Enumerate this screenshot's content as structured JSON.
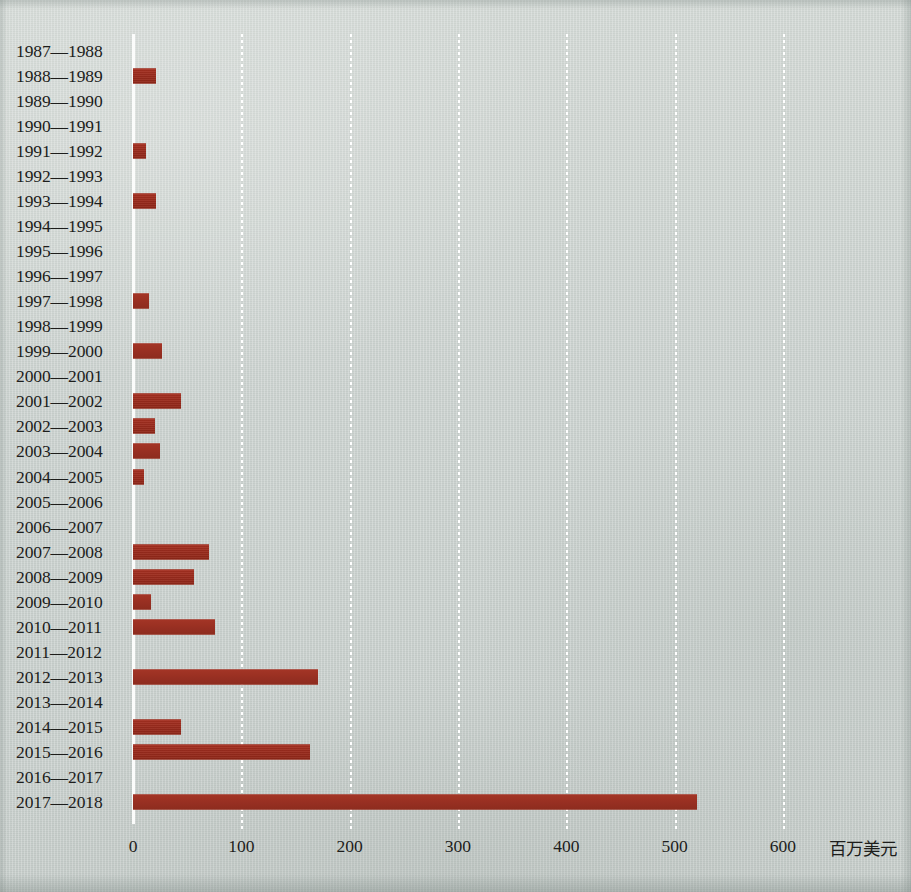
{
  "chart_data": {
    "type": "bar",
    "orientation": "horizontal",
    "title": "",
    "subtitle": "",
    "xlabel": "百万美元",
    "ylabel": "",
    "xlim": [
      0,
      620
    ],
    "xticks": [
      0,
      100,
      200,
      300,
      400,
      500,
      600
    ],
    "xtick_labels": [
      "0",
      "100",
      "200",
      "300",
      "400",
      "500",
      "600"
    ],
    "grid": "vertical-dotted-white",
    "legend": null,
    "bar_color": "#9c2b1d",
    "background_color": "#ccd2cf",
    "axis_color": "#fbfcfb",
    "text_color": "#1d1d1b",
    "categories": [
      "1987—1988",
      "1988—1989",
      "1989—1990",
      "1990—1991",
      "1991—1992",
      "1992—1993",
      "1993—1994",
      "1994—1995",
      "1995—1996",
      "1996—1997",
      "1997—1998",
      "1998—1999",
      "1999—2000",
      "2000—2001",
      "2001—2002",
      "2002—2003",
      "2003—2004",
      "2004—2005",
      "2005—2006",
      "2006—2007",
      "2007—2008",
      "2008—2009",
      "2009—2010",
      "2010—2011",
      "2011—2012",
      "2012—2013",
      "2013—2014",
      "2014—2015",
      "2015—2016",
      "2016—2017",
      "2017—2018"
    ],
    "values": [
      0,
      21,
      0,
      0,
      12,
      0,
      21,
      0,
      0,
      0,
      15,
      0,
      27,
      0,
      44,
      20,
      25,
      10,
      0,
      0,
      70,
      56,
      17,
      76,
      0,
      171,
      0,
      44,
      163,
      0,
      521
    ]
  }
}
